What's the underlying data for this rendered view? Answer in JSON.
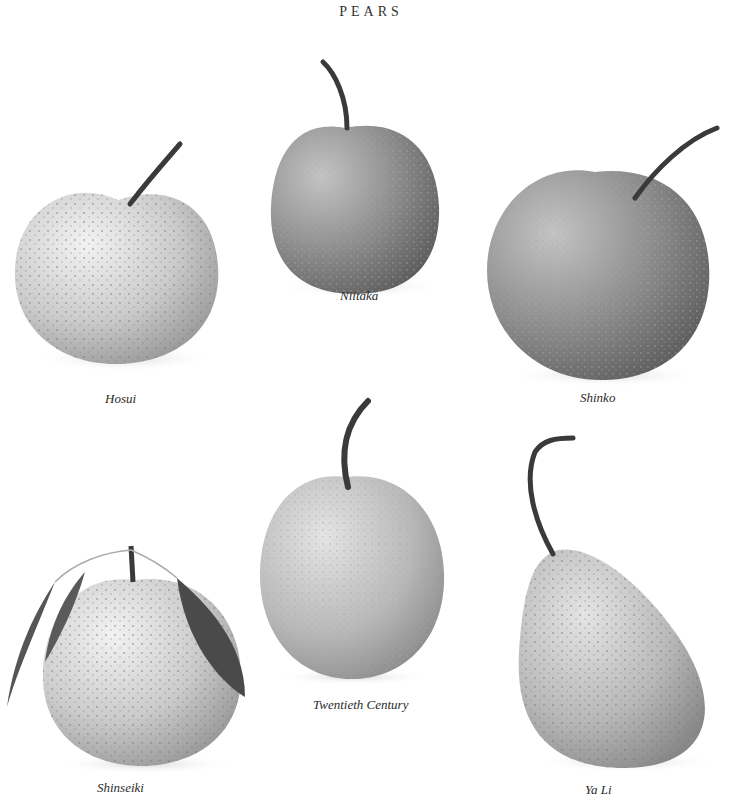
{
  "page": {
    "title": "PEARS"
  },
  "pears": [
    {
      "name": "Hosui",
      "shape": "round",
      "tone": "#cfcfcf"
    },
    {
      "name": "Niitaka",
      "shape": "round-tall",
      "tone": "#8f8f8f"
    },
    {
      "name": "Shinko",
      "shape": "round",
      "tone": "#939393"
    },
    {
      "name": "Shinseiki",
      "shape": "round-with-leaves",
      "tone": "#cdcdcd"
    },
    {
      "name": "Twentieth Century",
      "shape": "round",
      "tone": "#c2c2c2"
    },
    {
      "name": "Ya Li",
      "shape": "pyriform",
      "tone": "#b4b4b4"
    }
  ],
  "colors": {
    "background": "#ffffff",
    "stem": "#3a3a3a",
    "leaf": "#4a4a4a",
    "speckle": "#7a7a7a"
  }
}
